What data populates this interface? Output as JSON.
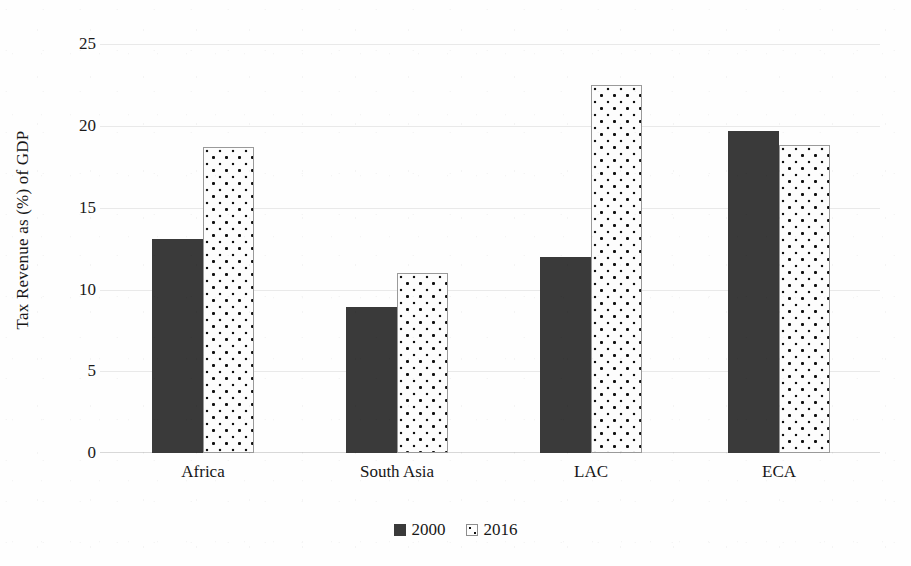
{
  "chart_data": {
    "type": "bar",
    "title": "",
    "subtitle": "",
    "xlabel": "",
    "ylabel": "Tax Revenue as (%) of GDP",
    "categories": [
      "Africa",
      "South Asia",
      "LAC",
      "ECA"
    ],
    "series": [
      {
        "name": "2000",
        "values": [
          13.1,
          8.9,
          12.0,
          19.7
        ],
        "color": "#3a3a3a",
        "pattern": "solid"
      },
      {
        "name": "2016",
        "values": [
          18.7,
          11.0,
          22.5,
          18.8
        ],
        "color": "#fdfdfd",
        "pattern": "dotted"
      }
    ],
    "ylim": [
      0,
      25
    ],
    "yticks": [
      0,
      5,
      10,
      15,
      20,
      25
    ],
    "ytick_labels": [
      "0",
      "5",
      "10",
      "15",
      "20",
      "25"
    ],
    "grid": true,
    "grid_axis": "y",
    "legend_position": "bottom",
    "legend_entries": [
      "2000",
      "2016"
    ]
  },
  "axis": {
    "y_title": "Tax Revenue as (%) of GDP",
    "y_tick_labels": [
      "25",
      "20",
      "15",
      "10",
      "5",
      "0"
    ],
    "x_tick_labels": [
      "Africa",
      "South Asia",
      "LAC",
      "ECA"
    ]
  },
  "legend": {
    "items": [
      {
        "label": "2000",
        "swatch": "filled-square-icon"
      },
      {
        "label": "2016",
        "swatch": "dotted-square-icon"
      }
    ]
  }
}
